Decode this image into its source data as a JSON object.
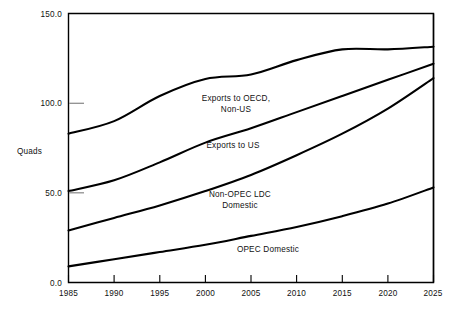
{
  "chart_data": {
    "type": "line",
    "title": "",
    "subtitle": "",
    "xlabel": "",
    "ylabel": "Quads",
    "xlim": [
      1985,
      2025
    ],
    "ylim": [
      0.0,
      150.0
    ],
    "grid": false,
    "legend_position": "inline-annotations",
    "x_ticks": [
      "1985",
      "1990",
      "1995",
      "2000",
      "2005",
      "2010",
      "2015",
      "2020",
      "2025"
    ],
    "y_ticks": [
      "0.0",
      "50.0",
      "100.0",
      "150.0"
    ],
    "x": [
      1985,
      1990,
      1995,
      2000,
      2005,
      2010,
      2015,
      2020,
      2025
    ],
    "series": [
      {
        "name": "Exports to OECD, Non-US",
        "label_line1": "Exports to OECD,",
        "label_line2": "Non-US",
        "values": [
          83.0,
          90.0,
          104.0,
          113.5,
          116.0,
          124.0,
          130.0,
          130.0,
          131.5
        ],
        "color": "#000000"
      },
      {
        "name": "Exports to US",
        "label_line1": "Exports to US",
        "label_line2": "",
        "values": [
          51.0,
          57.0,
          67.0,
          78.0,
          86.0,
          95.0,
          104.0,
          113.0,
          122.0
        ],
        "color": "#000000"
      },
      {
        "name": "Non-OPEC LDC Domestic",
        "label_line1": "Non-OPEC LDC",
        "label_line2": "Domestic",
        "values": [
          29.0,
          36.0,
          43.0,
          51.0,
          60.0,
          71.0,
          83.0,
          97.0,
          114.0
        ],
        "color": "#000000"
      },
      {
        "name": "OPEC Domestic",
        "label_line1": "OPEC Domestic",
        "label_line2": "",
        "values": [
          9.0,
          13.0,
          17.0,
          21.0,
          26.0,
          31.0,
          37.0,
          44.0,
          53.0
        ],
        "color": "#000000"
      }
    ],
    "annotations": [
      {
        "text": "Exports to OECD,",
        "x_px": 236,
        "y_px": 101
      },
      {
        "text": "Non-US",
        "x_px": 236,
        "y_px": 112
      },
      {
        "text": "Exports to US",
        "x_px": 233,
        "y_px": 148
      },
      {
        "text": "Non-OPEC LDC",
        "x_px": 240,
        "y_px": 197
      },
      {
        "text": "Domestic",
        "x_px": 240,
        "y_px": 208
      },
      {
        "text": "OPEC Domestic",
        "x_px": 268,
        "y_px": 252
      }
    ]
  },
  "axis": {
    "y_title": "Quads",
    "y_labels": [
      "150.0",
      "100.0",
      "50.0",
      "0.0"
    ],
    "x_labels": [
      "1985",
      "1990",
      "1995",
      "2000",
      "2005",
      "2010",
      "2015",
      "2020",
      "2025"
    ]
  },
  "colors": {
    "line": "#000000",
    "axis": "#000000",
    "background": "#ffffff",
    "y_tick_mark": "#8f8f8f"
  }
}
